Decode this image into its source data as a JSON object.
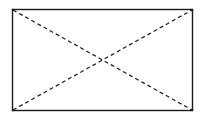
{
  "diagram": {
    "type": "rectangle-with-diagonals",
    "rect": {
      "x": 12,
      "y": 9,
      "width": 180,
      "height": 101
    },
    "stroke_color": "#1a1a1a",
    "border_style": "solid",
    "diagonal_style": "dashed",
    "diagonals": [
      {
        "name": "top-left-to-bottom-right"
      },
      {
        "name": "bottom-left-to-top-right"
      }
    ]
  }
}
